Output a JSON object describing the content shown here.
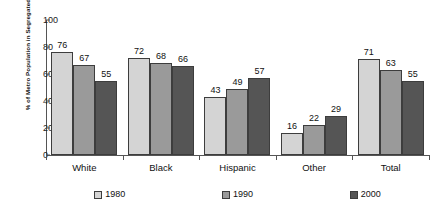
{
  "chart_data": {
    "type": "bar",
    "title": "",
    "xlabel": "",
    "ylabel": "% of Metro Population in Segregated Settings",
    "categories": [
      "White",
      "Black",
      "Hispanic",
      "Other",
      "Total"
    ],
    "series": [
      {
        "name": "1980",
        "values": [
          76,
          72,
          43,
          16,
          71
        ],
        "color": "#d4d4d4"
      },
      {
        "name": "1990",
        "values": [
          67,
          68,
          49,
          22,
          63
        ],
        "color": "#9a9a9a"
      },
      {
        "name": "2000",
        "values": [
          55,
          66,
          57,
          29,
          55
        ],
        "color": "#555555"
      }
    ],
    "ylim": [
      0,
      100
    ],
    "yticks": [
      0,
      20,
      40,
      60,
      80,
      100
    ],
    "ytick_labels": [
      "0",
      "20",
      "40",
      "60",
      "80",
      "100"
    ],
    "grid": false,
    "legend_position": "bottom",
    "data_labels": true
  },
  "axis": {
    "y_title": "% of Metro Population in Segregated Settings"
  }
}
